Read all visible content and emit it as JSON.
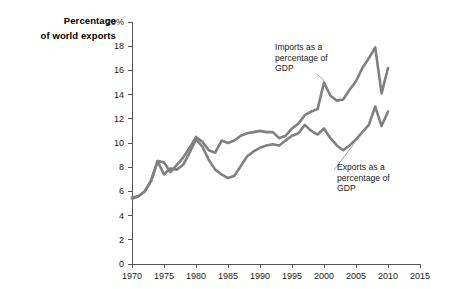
{
  "chart_data": {
    "type": "line",
    "title": "",
    "ylabel": "Percentage of world exports",
    "ylabel_lines": [
      "Percentage",
      "of world exports"
    ],
    "xlabel": "",
    "xlim": [
      1970,
      2015
    ],
    "ylim": [
      0,
      20
    ],
    "grid": false,
    "legend_position": "inline-annotations",
    "y_ticks": [
      0,
      2,
      4,
      6,
      8,
      10,
      12,
      14,
      16,
      18,
      20
    ],
    "y_tick_labels": [
      "0",
      "2",
      "4",
      "6",
      "8",
      "10",
      "12",
      "14",
      "16",
      "18",
      "20%"
    ],
    "x_ticks": [
      1970,
      1975,
      1980,
      1985,
      1990,
      1995,
      2000,
      2005,
      2010,
      2015
    ],
    "x_tick_labels": [
      "1970",
      "1975",
      "1980",
      "1985",
      "1990",
      "1995",
      "2000",
      "2005",
      "2010",
      "2015"
    ],
    "line_color": "#808080",
    "x": [
      1970,
      1971,
      1972,
      1973,
      1974,
      1975,
      1976,
      1977,
      1978,
      1979,
      1980,
      1981,
      1982,
      1983,
      1984,
      1985,
      1986,
      1987,
      1988,
      1989,
      1990,
      1991,
      1992,
      1993,
      1994,
      1995,
      1996,
      1997,
      1998,
      1999,
      2000,
      2001,
      2002,
      2003,
      2004,
      2005,
      2006,
      2007,
      2008,
      2009,
      2010
    ],
    "series": [
      {
        "name": "Imports as a percentage of GDP",
        "color": "#808080",
        "values": [
          5.5,
          5.6,
          6.0,
          6.9,
          8.5,
          8.4,
          7.6,
          8.2,
          8.8,
          9.6,
          10.5,
          10.1,
          9.4,
          9.2,
          10.2,
          10.0,
          10.2,
          10.6,
          10.8,
          10.9,
          11.0,
          10.9,
          10.9,
          10.4,
          10.6,
          11.2,
          11.6,
          12.3,
          12.6,
          12.8,
          15.0,
          13.9,
          13.5,
          13.6,
          14.4,
          15.1,
          16.2,
          17.0,
          17.9,
          14.1,
          16.2
        ]
      },
      {
        "name": "Exports as a percentage of GDP",
        "color": "#808080",
        "values": [
          5.4,
          5.6,
          6.0,
          6.9,
          8.5,
          7.4,
          7.9,
          7.8,
          8.2,
          9.2,
          10.3,
          9.7,
          8.6,
          7.8,
          7.4,
          7.1,
          7.3,
          8.1,
          8.9,
          9.3,
          9.6,
          9.8,
          9.9,
          9.8,
          10.2,
          10.6,
          10.8,
          11.5,
          11.0,
          10.7,
          11.2,
          10.4,
          9.8,
          9.4,
          9.8,
          10.3,
          10.9,
          11.5,
          13.0,
          11.4,
          12.6
        ]
      }
    ],
    "annotations": [
      {
        "id": "imports",
        "text_lines": [
          "Imports as a",
          "percentage of",
          "GDP"
        ],
        "target_year": 2000,
        "target_value": 15.0
      },
      {
        "id": "exports",
        "text_lines": [
          "Exports as a",
          "percentage of",
          "GDP"
        ],
        "target_year": 2007,
        "target_value": 11.5
      }
    ]
  }
}
